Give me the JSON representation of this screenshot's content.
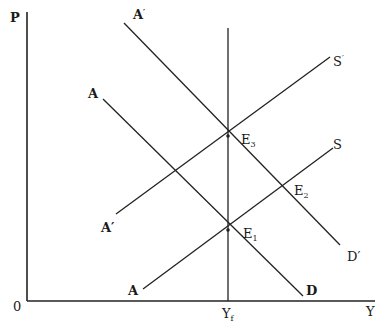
{
  "diagram": {
    "axes": {
      "y_label": "P",
      "x_label": "Y",
      "origin_label": "0",
      "full_employment_label": "Y",
      "full_employment_subscript": "f"
    },
    "curves": {
      "ad_original": {
        "start_label": "A",
        "end_label": "D"
      },
      "ad_shifted": {
        "start_label": "A",
        "start_prime": "′",
        "end_label": "D′"
      },
      "as_original": {
        "start_label": "A",
        "end_label": "S"
      },
      "as_shifted": {
        "start_label": "A′",
        "end_label": "S",
        "end_prime": "′"
      }
    },
    "equilibria": {
      "e1": {
        "label": "E",
        "subscript": "1"
      },
      "e2": {
        "label": "E",
        "subscript": "2"
      },
      "e3": {
        "label": "E",
        "subscript": "3"
      }
    },
    "colors": {
      "line": "#222222",
      "background": "#ffffff"
    }
  }
}
